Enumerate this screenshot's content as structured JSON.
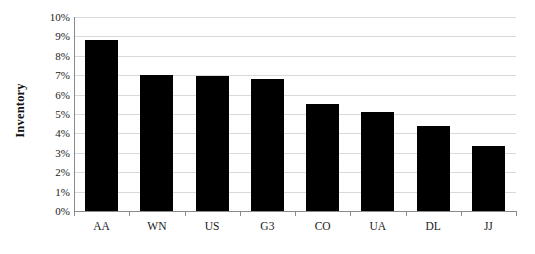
{
  "chart_data": {
    "type": "bar",
    "title": "",
    "xlabel": "",
    "ylabel": "Inventory",
    "categories": [
      "AA",
      "WN",
      "US",
      "G3",
      "CO",
      "UA",
      "DL",
      "JJ"
    ],
    "values": [
      8.8,
      7.0,
      6.95,
      6.8,
      5.5,
      5.1,
      4.4,
      3.35
    ],
    "ylim": [
      0,
      10
    ],
    "ytick_step": 1,
    "ytick_labels": [
      "0%",
      "1%",
      "2%",
      "3%",
      "4%",
      "5%",
      "6%",
      "7%",
      "8%",
      "9%",
      "10%"
    ],
    "ytick_values": [
      0,
      1,
      2,
      3,
      4,
      5,
      6,
      7,
      8,
      9,
      10
    ],
    "grid": true,
    "legend": false,
    "legend_position": "none",
    "bar_color": "#000000",
    "gridline_color": "#d9d9d9",
    "axis_color": "#8a8a8a",
    "background_color": "#ffffff",
    "value_unit": "percent"
  }
}
